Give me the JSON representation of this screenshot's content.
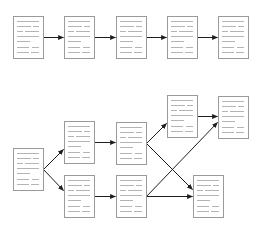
{
  "diagram": {
    "kind": "document-flow",
    "colors": {
      "background": "#ffffff",
      "document_border": "#9a9a9a",
      "document_text_lines": "#b4b4b4",
      "arrow": "#1e1e1e"
    },
    "document_size": {
      "width": 30,
      "height": 42
    },
    "text_line_pattern": [
      [
        [
          4,
          26
        ]
      ],
      [
        [
          4,
          18
        ],
        [
          20,
          26
        ]
      ],
      [
        [
          4,
          10
        ],
        [
          12,
          26
        ]
      ],
      [
        [
          4,
          26
        ]
      ],
      [
        [
          4,
          17
        ]
      ],
      [
        [
          4,
          16
        ],
        [
          19,
          26
        ]
      ],
      [
        [
          4,
          16
        ],
        [
          18,
          26
        ]
      ]
    ],
    "sections": [
      {
        "id": "linear-chain",
        "label": "Linear sequence",
        "nodes": [
          {
            "id": "L1",
            "x": 13,
            "y": 16
          },
          {
            "id": "L2",
            "x": 64,
            "y": 16
          },
          {
            "id": "L3",
            "x": 116,
            "y": 16
          },
          {
            "id": "L4",
            "x": 167,
            "y": 16
          },
          {
            "id": "L5",
            "x": 218,
            "y": 16
          }
        ],
        "edges": [
          {
            "from": "L1",
            "to": "L2",
            "x1": 43,
            "y1": 37,
            "x2": 63,
            "y2": 37
          },
          {
            "from": "L2",
            "to": "L3",
            "x1": 94,
            "y1": 37,
            "x2": 115,
            "y2": 37
          },
          {
            "from": "L3",
            "to": "L4",
            "x1": 146,
            "y1": 37,
            "x2": 166,
            "y2": 37
          },
          {
            "from": "L4",
            "to": "L5",
            "x1": 197,
            "y1": 37,
            "x2": 217,
            "y2": 37
          }
        ]
      },
      {
        "id": "branching-graph",
        "label": "Branching network",
        "nodes": [
          {
            "id": "B0",
            "x": 13,
            "y": 148
          },
          {
            "id": "B1a",
            "x": 64,
            "y": 121
          },
          {
            "id": "B1b",
            "x": 64,
            "y": 175
          },
          {
            "id": "B2a",
            "x": 116,
            "y": 122
          },
          {
            "id": "B2b",
            "x": 116,
            "y": 175
          },
          {
            "id": "B3a",
            "x": 167,
            "y": 95
          },
          {
            "id": "B3b",
            "x": 218,
            "y": 96
          },
          {
            "id": "B3c",
            "x": 193,
            "y": 175
          }
        ],
        "edges": [
          {
            "from": "B0",
            "to": "B1a",
            "x1": 43,
            "y1": 169,
            "x2": 63,
            "y2": 149
          },
          {
            "from": "B0",
            "to": "B1b",
            "x1": 43,
            "y1": 169,
            "x2": 63,
            "y2": 190
          },
          {
            "from": "B1a",
            "to": "B2a",
            "x1": 94,
            "y1": 142,
            "x2": 115,
            "y2": 142
          },
          {
            "from": "B1b",
            "to": "B2b",
            "x1": 94,
            "y1": 196,
            "x2": 115,
            "y2": 196
          },
          {
            "from": "B2a",
            "to": "B3a",
            "x1": 146,
            "y1": 143,
            "x2": 166,
            "y2": 123
          },
          {
            "from": "B2a",
            "to": "B3c",
            "x1": 146,
            "y1": 143,
            "x2": 192,
            "y2": 189
          },
          {
            "from": "B2b",
            "to": "B3c",
            "x1": 146,
            "y1": 196,
            "x2": 192,
            "y2": 196
          },
          {
            "from": "B2b",
            "to": "B3b",
            "x1": 146,
            "y1": 196,
            "x2": 217,
            "y2": 122
          },
          {
            "from": "B3a",
            "to": "B3b",
            "x1": 197,
            "y1": 116,
            "x2": 217,
            "y2": 116
          }
        ]
      }
    ]
  }
}
